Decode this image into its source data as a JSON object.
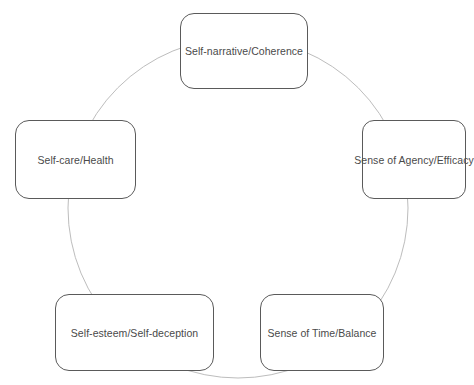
{
  "diagram": {
    "type": "cycle",
    "ring_color": "#bdbdbd",
    "border_color": "#5a5a5a",
    "text_color": "#4a4a4a",
    "nodes": [
      {
        "id": "top",
        "label": "Self-narrative/Coherence"
      },
      {
        "id": "right",
        "label": "Sense of Agency/Efficacy"
      },
      {
        "id": "bottom-right",
        "label": "Sense of Time/Balance"
      },
      {
        "id": "bottom-left",
        "label": "Self-esteem/Self-deception"
      },
      {
        "id": "left",
        "label": "Self-care/Health"
      }
    ]
  }
}
